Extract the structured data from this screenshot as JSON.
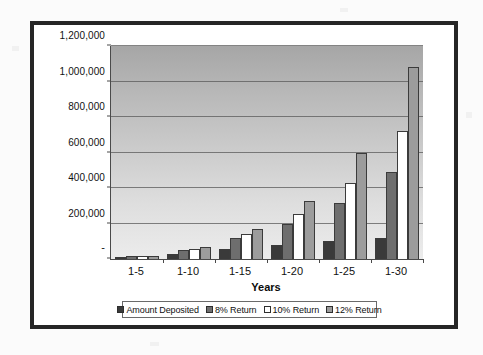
{
  "chart_data": {
    "type": "bar",
    "title": "",
    "xlabel": "Years",
    "ylabel": "",
    "categories": [
      "1-5",
      "1-10",
      "1-15",
      "1-20",
      "1-25",
      "1-30"
    ],
    "series": [
      {
        "name": "Amount Deposited",
        "color": "#3a3a3a",
        "values": [
          10000,
          30000,
          55000,
          80000,
          100000,
          120000
        ]
      },
      {
        "name": "8% Return",
        "color": "#6e6e6e",
        "values": [
          15000,
          48000,
          118000,
          200000,
          315000,
          490000
        ]
      },
      {
        "name": "10% Return",
        "color": "#ffffff",
        "values": [
          16000,
          58000,
          142000,
          252000,
          430000,
          720000
        ]
      },
      {
        "name": "12% Return",
        "color": "#9c9c9c",
        "values": [
          17000,
          68000,
          170000,
          325000,
          595000,
          1080000
        ]
      }
    ],
    "ylim": [
      0,
      1200000
    ],
    "ytick_values": [
      0,
      200000,
      400000,
      600000,
      800000,
      1000000,
      1200000
    ],
    "ytick_labels": [
      "-",
      "200,000",
      "400,000",
      "600,000",
      "800,000",
      "1,000,000",
      "1,200,000"
    ],
    "grid": true,
    "legend_position": "bottom"
  },
  "axes": {
    "x_title": "Years"
  },
  "legend": {
    "items": [
      {
        "label": "Amount Deposited",
        "color": "#3a3a3a"
      },
      {
        "label": "8% Return",
        "color": "#6e6e6e"
      },
      {
        "label": "10% Return",
        "color": "#ffffff"
      },
      {
        "label": "12% Return",
        "color": "#9c9c9c"
      }
    ]
  },
  "style": {
    "frame_color": "#262626",
    "plot_bg_top": "#a6a6a6",
    "plot_bg_bottom": "#ececec",
    "gridline_color": "#5a5a5a",
    "axis_color": "#4a4a4a"
  }
}
